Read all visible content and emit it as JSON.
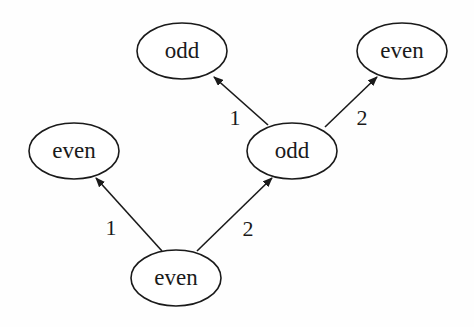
{
  "diagram": {
    "type": "tree",
    "nodes": [
      {
        "id": "n_root",
        "label": "even",
        "cx": 176,
        "cy": 278,
        "rx": 45,
        "ry": 28
      },
      {
        "id": "n_left",
        "label": "even",
        "cx": 74,
        "cy": 151,
        "rx": 45,
        "ry": 28
      },
      {
        "id": "n_mid",
        "label": "odd",
        "cx": 292,
        "cy": 151,
        "rx": 45,
        "ry": 28
      },
      {
        "id": "n_tl",
        "label": "odd",
        "cx": 182,
        "cy": 51,
        "rx": 45,
        "ry": 28
      },
      {
        "id": "n_tr",
        "label": "even",
        "cx": 402,
        "cy": 51,
        "rx": 45,
        "ry": 28
      }
    ],
    "edges": [
      {
        "from": "n_root",
        "to": "n_left",
        "label": "1",
        "x1": 162,
        "y1": 251,
        "x2": 96,
        "y2": 178,
        "lx": 111,
        "ly": 227
      },
      {
        "from": "n_root",
        "to": "n_mid",
        "label": "2",
        "x1": 197,
        "y1": 251,
        "x2": 272,
        "y2": 178,
        "lx": 248,
        "ly": 228
      },
      {
        "from": "n_mid",
        "to": "n_tl",
        "label": "1",
        "x1": 268,
        "y1": 125,
        "x2": 214,
        "y2": 77,
        "lx": 235,
        "ly": 117
      },
      {
        "from": "n_mid",
        "to": "n_tr",
        "label": "2",
        "x1": 325,
        "y1": 127,
        "x2": 377,
        "y2": 77,
        "lx": 362,
        "ly": 117
      }
    ]
  },
  "colors": {
    "ink": "#1a1a1a",
    "background": "#ffffff"
  }
}
